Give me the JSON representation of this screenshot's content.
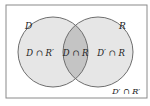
{
  "diagram": {
    "type": "venn",
    "sets": [
      {
        "id": "D",
        "label": "D"
      },
      {
        "id": "R",
        "label": "R"
      }
    ],
    "regions": {
      "d_only": "D ∩ R′",
      "both": "D ∩ R",
      "r_only": "D′ ∩ R",
      "neither": "D′ ∩ R′"
    },
    "colors": {
      "background": "#ffffff",
      "frame": "#8a8a8a",
      "circle_fill": "#e6e6e6",
      "intersection_fill": "#c4c4c4",
      "circle_stroke": "#6e6e6e",
      "text": "#222222"
    }
  }
}
